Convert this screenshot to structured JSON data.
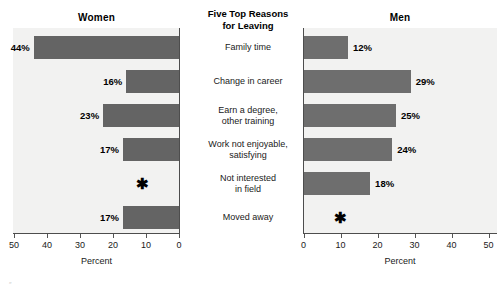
{
  "center": {
    "heading_line1": "Five Top Reasons",
    "heading_line2": "for Leaving"
  },
  "panels": {
    "left": {
      "title": "Women",
      "axis_caption": "Percent"
    },
    "right": {
      "title": "Men",
      "axis_caption": "Percent"
    }
  },
  "categories": [
    {
      "line1": "Family time",
      "line2": ""
    },
    {
      "line1": "Change in career",
      "line2": ""
    },
    {
      "line1": "Earn a degree,",
      "line2": "other training"
    },
    {
      "line1": "Work not enjoyable,",
      "line2": "satisfying"
    },
    {
      "line1": "Not interested",
      "line2": "in field"
    },
    {
      "line1": "Moved away",
      "line2": ""
    }
  ],
  "women_labels": [
    "44%",
    "16%",
    "23%",
    "17%",
    "*",
    "17%"
  ],
  "men_labels": [
    "12%",
    "29%",
    "25%",
    "24%",
    "18%",
    "*"
  ],
  "left_ticks": [
    "50",
    "40",
    "30",
    "20",
    "10",
    "0"
  ],
  "right_ticks": [
    "0",
    "10",
    "20",
    "30",
    "40",
    "50"
  ],
  "suppressed_symbol": "✱",
  "colors": {
    "bar": "#6b6b6b",
    "plot_background": "#f2f2f1",
    "axis": "#4d4d4d",
    "text": "#1a1a1a"
  },
  "footnote_mark": "″",
  "chart_data": {
    "type": "bar",
    "title": "Five Top Reasons for Leaving",
    "orientation": "horizontal",
    "panels": [
      "Women",
      "Men"
    ],
    "categories": [
      "Family time",
      "Change in career",
      "Earn a degree, other training",
      "Work not enjoyable, satisfying",
      "Not interested in field",
      "Moved away"
    ],
    "series": [
      {
        "name": "Women",
        "values": [
          44,
          16,
          23,
          17,
          null,
          17
        ],
        "direction": "right-to-left",
        "xlim": [
          0,
          50
        ]
      },
      {
        "name": "Men",
        "values": [
          12,
          29,
          25,
          24,
          18,
          null
        ],
        "direction": "left-to-right",
        "xlim": [
          0,
          50
        ]
      }
    ],
    "xlabel": "Percent",
    "ylabel": "",
    "xlim": [
      0,
      50
    ],
    "xticks": [
      0,
      10,
      20,
      30,
      40,
      50
    ],
    "grid": false,
    "legend": "none"
  }
}
